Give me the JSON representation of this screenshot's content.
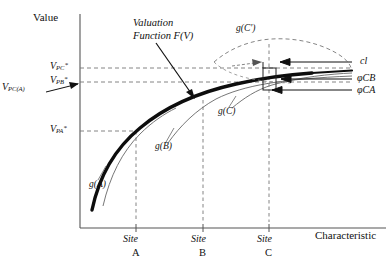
{
  "figure": {
    "type": "schematic-diagram",
    "y_axis_label": "Value",
    "x_axis_label": "Characteristic",
    "annotation_title": "Valuation",
    "annotation_title_line2": "Function F(V)"
  },
  "y_ticks": [
    {
      "name": "V_PC*",
      "base": "V",
      "sub": "PC",
      "sup": "*",
      "y": 68
    },
    {
      "name": "V_PB*",
      "base": "V",
      "sub": "PB",
      "sup": "*",
      "y": 82
    },
    {
      "name": "V_PA*",
      "base": "V",
      "sub": "PA",
      "sup": "*",
      "y": 131
    }
  ],
  "axis_point_label": {
    "base": "V",
    "sub": "PC(A)",
    "x": 6,
    "y": 88
  },
  "x_ticks": [
    {
      "site_word": "Site",
      "site_letter": "A",
      "x": 133
    },
    {
      "site_word": "Site",
      "site_letter": "B",
      "x": 202
    },
    {
      "site_word": "Site",
      "site_letter": "C",
      "x": 268
    }
  ],
  "curve_labels": [
    {
      "name": "g(A)",
      "text": "g(A)",
      "x": 89,
      "y": 186
    },
    {
      "name": "g(B)",
      "text": "g(B)",
      "x": 155,
      "y": 148
    },
    {
      "name": "g(C)",
      "text": "g(C)",
      "x": 218,
      "y": 113
    },
    {
      "name": "g(C')",
      "text": "g(C')",
      "x": 238,
      "y": 28
    }
  ],
  "right_labels": [
    {
      "name": "cl",
      "text": "cl",
      "x": 360,
      "y": 62
    },
    {
      "name": "phiCB",
      "text": "φCB",
      "x": 358,
      "y": 79
    },
    {
      "name": "phiCA",
      "text": "φCA",
      "x": 358,
      "y": 90
    }
  ],
  "colors": {
    "ink": "#111111",
    "thin": "#555555",
    "dashed": "#777777",
    "background": "#ffffff"
  }
}
